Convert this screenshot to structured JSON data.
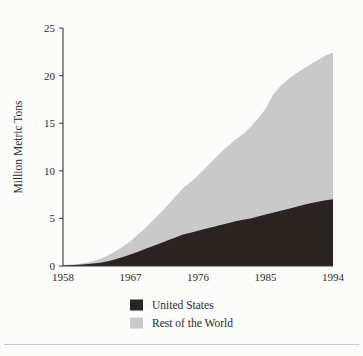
{
  "chart_data": {
    "type": "area",
    "stacked": true,
    "title": "",
    "subtitle": "",
    "xlabel": "",
    "ylabel": "Million Metric Tons",
    "xlim": [
      1958,
      1994
    ],
    "ylim": [
      0,
      25
    ],
    "grid": false,
    "legend_position": "bottom-center",
    "x_tick_labels": [
      "1958",
      "1967",
      "1976",
      "1985",
      "1994"
    ],
    "x_ticks": [
      1958,
      1967,
      1976,
      1985,
      1994
    ],
    "y_tick_labels": [
      "0",
      "5",
      "10",
      "15",
      "20",
      "25"
    ],
    "y_ticks": [
      0,
      5,
      10,
      15,
      20,
      25
    ],
    "x": [
      1958,
      1959,
      1960,
      1961,
      1962,
      1963,
      1964,
      1965,
      1966,
      1967,
      1968,
      1969,
      1970,
      1971,
      1972,
      1973,
      1974,
      1975,
      1976,
      1977,
      1978,
      1979,
      1980,
      1981,
      1982,
      1983,
      1984,
      1985,
      1986,
      1987,
      1988,
      1989,
      1990,
      1991,
      1992,
      1993,
      1994
    ],
    "series": [
      {
        "name": "United States",
        "color": "#2a2320",
        "values": [
          0.05,
          0.08,
          0.12,
          0.18,
          0.25,
          0.35,
          0.5,
          0.7,
          0.95,
          1.2,
          1.5,
          1.8,
          2.1,
          2.4,
          2.7,
          3.0,
          3.3,
          3.5,
          3.7,
          3.9,
          4.1,
          4.3,
          4.5,
          4.7,
          4.85,
          5.0,
          5.2,
          5.4,
          5.6,
          5.8,
          6.0,
          6.2,
          6.4,
          6.6,
          6.75,
          6.9,
          7.0
        ]
      },
      {
        "name": "Rest of the World",
        "color": "#c9c9c9",
        "values": [
          0.05,
          0.07,
          0.1,
          0.15,
          0.25,
          0.4,
          0.6,
          0.85,
          1.1,
          1.4,
          1.8,
          2.2,
          2.7,
          3.2,
          3.7,
          4.3,
          4.9,
          5.3,
          5.8,
          6.4,
          7.0,
          7.6,
          8.1,
          8.6,
          9.0,
          9.6,
          10.3,
          11.1,
          12.4,
          13.1,
          13.6,
          14.0,
          14.3,
          14.6,
          14.9,
          15.2,
          15.4
        ]
      }
    ],
    "totals": [
      0.1,
      0.15,
      0.22,
      0.33,
      0.5,
      0.75,
      1.1,
      1.55,
      2.05,
      2.6,
      3.3,
      4.0,
      4.8,
      5.6,
      6.4,
      7.3,
      8.2,
      8.8,
      9.5,
      10.3,
      11.1,
      11.9,
      12.6,
      13.3,
      13.85,
      14.6,
      15.5,
      16.5,
      18.0,
      18.9,
      19.6,
      20.2,
      20.7,
      21.2,
      21.65,
      22.1,
      22.4
    ]
  },
  "legend": {
    "items": [
      {
        "label": "United States",
        "color": "#2a2320"
      },
      {
        "label": "Rest of the World",
        "color": "#c9c9c9"
      }
    ]
  },
  "axis": {
    "y_title": "Million Metric Tons"
  }
}
